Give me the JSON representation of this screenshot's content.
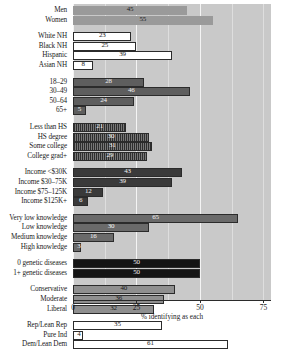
{
  "chart_data": {
    "type": "bar",
    "orientation": "horizontal",
    "title": "",
    "xlabel": "% identifying as each",
    "ylabel": "",
    "xlim": [
      0,
      78
    ],
    "xticks": [
      0,
      25,
      50,
      75
    ],
    "grid": true,
    "legend": "none",
    "categories": [
      "Men",
      "Women",
      "White NH",
      "Black NH",
      "Hispanic",
      "Asian NH",
      "18–29",
      "30–49",
      "50–64",
      "65+",
      "Less than HS",
      "HS degree",
      "Some college",
      "College grad+",
      "Income <$30K",
      "Income $30–75K",
      "Income $75–125K",
      "Income $125K+",
      "Very low knowledge",
      "Low knowledge",
      "Medium knowledge",
      "High knowledge",
      "0 genetic diseases",
      "1+ genetic diseases",
      "Conservative",
      "Moderate",
      "Liberal",
      "Rep/Lean Rep",
      "Pure Ind",
      "Dem/Lean Dem"
    ],
    "values": [
      45,
      55,
      23,
      25,
      39,
      8,
      28,
      46,
      24,
      5,
      21,
      30,
      31,
      29,
      43,
      39,
      12,
      6,
      65,
      30,
      16,
      3,
      50,
      50,
      40,
      36,
      32,
      35,
      4,
      61
    ],
    "groups": [
      {
        "name": "sex",
        "style": "solid-gray",
        "label_color": "dark",
        "rows": [
          0,
          1
        ]
      },
      {
        "name": "race",
        "style": "white",
        "label_color": "dark",
        "rows": [
          2,
          3,
          4,
          5
        ]
      },
      {
        "name": "age",
        "style": "dark-gray",
        "label_color": "light",
        "rows": [
          6,
          7,
          8,
          9
        ]
      },
      {
        "name": "education",
        "style": "hatched-dark",
        "label_color": "light",
        "rows": [
          10,
          11,
          12,
          13
        ]
      },
      {
        "name": "income",
        "style": "dark",
        "label_color": "light",
        "rows": [
          14,
          15,
          16,
          17
        ]
      },
      {
        "name": "knowledge",
        "style": "mid-gray",
        "label_color": "light",
        "rows": [
          18,
          19,
          20,
          21
        ]
      },
      {
        "name": "genetic-diseases",
        "style": "black",
        "label_color": "light",
        "rows": [
          22,
          23
        ]
      },
      {
        "name": "ideology",
        "style": "dotted",
        "label_color": "dark",
        "rows": [
          24,
          25,
          26
        ]
      },
      {
        "name": "party",
        "style": "white",
        "label_color": "dark",
        "rows": [
          27,
          28,
          29
        ]
      }
    ]
  },
  "axis": {
    "x_title": "% identifying as each",
    "tick_labels": [
      "0",
      "25",
      "50",
      "75"
    ]
  },
  "colors": {
    "plot_background": "#c9c9c9",
    "gridline": "#f4f4f4",
    "axis": "#2b2b2b",
    "solid_gray": "#9a9a9a",
    "white": "#ffffff",
    "dark_gray": "#5e5e5e",
    "hatched_dark": "#2e2e2e",
    "dark": "#3a3a3a",
    "mid_gray": "#6a6a6a",
    "black": "#141414",
    "dotted": "#8f8f8f"
  }
}
